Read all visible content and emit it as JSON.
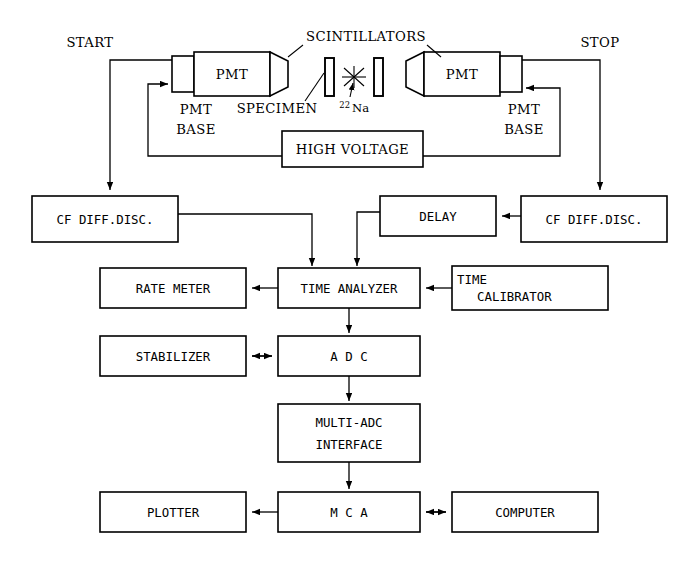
{
  "diagram": {
    "stroke_color": "#000000",
    "background_color": "#ffffff",
    "signal_labels": {
      "start": "START",
      "stop": "STOP"
    },
    "detector_labels": {
      "pmt_left": "PMT",
      "pmt_right": "PMT",
      "pmt_base_left_line1": "PMT",
      "pmt_base_left_line2": "BASE",
      "pmt_base_right_line1": "PMT",
      "pmt_base_right_line2": "BASE",
      "scintillators": "SCINTILLATORS",
      "specimen": "SPECIMEN",
      "source_mass": "22",
      "source_element": "Na"
    },
    "boxes": {
      "high_voltage": "HIGH VOLTAGE",
      "cf_diff_disc_left": "CF DIFF.DISC.",
      "cf_diff_disc_right": "CF DIFF.DISC.",
      "delay": "DELAY",
      "rate_meter": "RATE METER",
      "time_analyzer": "TIME ANALYZER",
      "time_calibrator_line1": "TIME",
      "time_calibrator_line2": "CALIBRATOR",
      "stabilizer": "STABILIZER",
      "adc": "A D C",
      "multi_adc_line1": "MULTI-ADC",
      "multi_adc_line2": "INTERFACE",
      "plotter": "PLOTTER",
      "mca": "M C A",
      "computer": "COMPUTER"
    }
  }
}
